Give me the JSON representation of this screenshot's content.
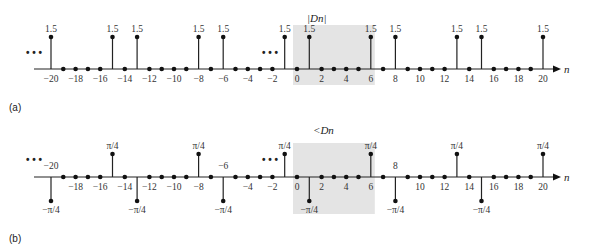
{
  "chart_data": [
    {
      "panel": "(a)",
      "type": "stem",
      "title": "|D_n|",
      "xlabel": "n",
      "x_ticks": [
        -20,
        -18,
        -16,
        -14,
        -12,
        -10,
        -8,
        -6,
        -4,
        -2,
        0,
        2,
        4,
        6,
        8,
        10,
        12,
        14,
        16,
        18,
        20
      ],
      "x": [
        -20,
        -19,
        -18,
        -17,
        -16,
        -15,
        -14,
        -13,
        -12,
        -11,
        -10,
        -9,
        -8,
        -7,
        -6,
        -5,
        -4,
        -3,
        -2,
        -1,
        0,
        1,
        2,
        3,
        4,
        5,
        6,
        7,
        8,
        9,
        10,
        11,
        12,
        13,
        14,
        15,
        16,
        17,
        18,
        19,
        20
      ],
      "values": [
        1.5,
        0,
        0,
        0,
        0,
        1.5,
        0,
        1.5,
        0,
        0,
        0,
        0,
        1.5,
        0,
        1.5,
        0,
        0,
        0,
        0,
        1.5,
        0,
        1.5,
        0,
        0,
        0,
        0,
        1.5,
        0,
        1.5,
        0,
        0,
        0,
        0,
        1.5,
        0,
        1.5,
        0,
        0,
        0,
        0,
        1.5
      ],
      "nonzero_label": "1.5",
      "highlight_range": [
        0,
        6
      ],
      "ellipsis": true
    },
    {
      "panel": "(b)",
      "type": "stem",
      "title": "<D_n",
      "xlabel": "n",
      "x_ticks": [
        -20,
        -18,
        -16,
        -14,
        -12,
        -10,
        -8,
        -6,
        -4,
        -2,
        0,
        2,
        4,
        6,
        8,
        10,
        12,
        14,
        16,
        18,
        20
      ],
      "x": [
        -20,
        -19,
        -18,
        -17,
        -16,
        -15,
        -14,
        -13,
        -12,
        -11,
        -10,
        -9,
        -8,
        -7,
        -6,
        -5,
        -4,
        -3,
        -2,
        -1,
        0,
        1,
        2,
        3,
        4,
        5,
        6,
        7,
        8,
        9,
        10,
        11,
        12,
        13,
        14,
        15,
        16,
        17,
        18,
        19,
        20
      ],
      "values": [
        "-π/4",
        0,
        0,
        0,
        0,
        "π/4",
        0,
        "-π/4",
        0,
        0,
        0,
        0,
        "π/4",
        0,
        "-π/4",
        0,
        0,
        0,
        0,
        "π/4",
        0,
        "-π/4",
        0,
        0,
        0,
        0,
        "π/4",
        0,
        "-π/4",
        0,
        0,
        0,
        0,
        "π/4",
        0,
        "-π/4",
        0,
        0,
        0,
        0,
        "π/4"
      ],
      "up_label": "π/4",
      "down_label": "−π/4",
      "highlight_range": [
        0,
        6
      ],
      "ellipsis": true
    }
  ],
  "labels": {
    "panel_a": "(a)",
    "panel_b": "(b)",
    "title_a": "|Dn|",
    "title_b": "<Dn",
    "axis_var": "n",
    "ellipsis": "• • •"
  }
}
